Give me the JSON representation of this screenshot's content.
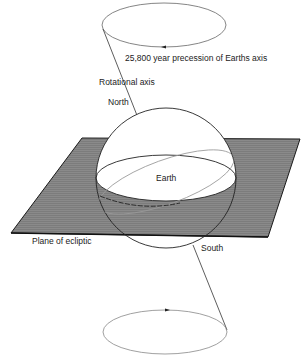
{
  "diagram": {
    "type": "earth-precession",
    "labels": {
      "precession": "25,800 year precession of Earths axis",
      "rotational_axis": "Rotational axis",
      "north": "North",
      "earth": "Earth",
      "plane": "Plane of ecliptic",
      "south": "South"
    },
    "colors": {
      "plane_fill": "#7a7a7a",
      "plane_edge": "#1a1a1a",
      "lines": "#333333",
      "light_lines": "#9a9a9a"
    }
  }
}
